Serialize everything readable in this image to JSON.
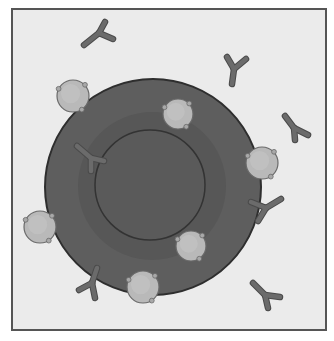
{
  "diagram": {
    "title": "",
    "colors": {
      "page_bg": "#ffffff",
      "frame_bg": "#ebebeb",
      "frame_border": "#555555",
      "cell_fill": "#5e5e5e",
      "cell_outline": "#2e2e2e",
      "cytoplasm_ring": "#575757",
      "nucleus_fill": "#5a5a5a",
      "nucleus_outline": "#333333",
      "sphere_fill": "#b9b9b9",
      "sphere_outline": "#6a6a6a",
      "antibody_fill": "#6b6b6b",
      "antibody_outline": "#4a4a4a"
    },
    "frame": {
      "x": 12,
      "y": 9,
      "w": 314,
      "h": 321
    },
    "cell": {
      "cx": 153,
      "cy": 187,
      "r": 108
    },
    "ring": {
      "cx": 152,
      "cy": 186,
      "r": 74
    },
    "nucleus": {
      "cx": 150,
      "cy": 185,
      "r": 55
    },
    "spheres": [
      {
        "id": "sphere-1",
        "cx": 73,
        "cy": 96,
        "r": 16
      },
      {
        "id": "sphere-2",
        "cx": 178,
        "cy": 114,
        "r": 15
      },
      {
        "id": "sphere-3",
        "cx": 262,
        "cy": 163,
        "r": 16
      },
      {
        "id": "sphere-4",
        "cx": 40,
        "cy": 227,
        "r": 16
      },
      {
        "id": "sphere-5",
        "cx": 191,
        "cy": 246,
        "r": 15
      },
      {
        "id": "sphere-6",
        "cx": 143,
        "cy": 287,
        "r": 16
      }
    ],
    "antibodies": [
      {
        "id": "antibody-1",
        "stem": [
          84,
          45,
          99,
          33
        ],
        "arm1": [
          99,
          33,
          105,
          22
        ],
        "arm2": [
          99,
          33,
          113,
          39
        ]
      },
      {
        "id": "antibody-2",
        "stem": [
          232,
          84,
          234,
          69
        ],
        "arm1": [
          234,
          69,
          227,
          57
        ],
        "arm2": [
          234,
          69,
          246,
          59
        ]
      },
      {
        "id": "antibody-3",
        "stem": [
          294,
          128,
          295,
          140
        ],
        "arm1": [
          294,
          128,
          285,
          116
        ],
        "arm2": [
          294,
          128,
          308,
          135
        ]
      },
      {
        "id": "antibody-4",
        "stem": [
          91,
          158,
          91,
          171
        ],
        "arm1": [
          91,
          158,
          77,
          146
        ],
        "arm2": [
          91,
          158,
          104,
          161
        ]
      },
      {
        "id": "antibody-5",
        "stem": [
          266,
          208,
          258,
          221
        ],
        "arm1": [
          266,
          208,
          251,
          202
        ],
        "arm2": [
          266,
          208,
          281,
          199
        ]
      },
      {
        "id": "antibody-6",
        "stem": [
          92,
          283,
          95,
          298
        ],
        "arm1": [
          92,
          283,
          97,
          268
        ],
        "arm2": [
          92,
          283,
          79,
          290
        ]
      },
      {
        "id": "antibody-7",
        "stem": [
          265,
          295,
          268,
          308
        ],
        "arm1": [
          265,
          295,
          253,
          283
        ],
        "arm2": [
          265,
          295,
          280,
          297
        ]
      }
    ]
  }
}
